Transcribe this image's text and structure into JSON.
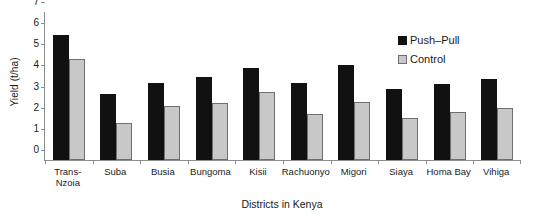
{
  "chart_data": {
    "type": "bar",
    "title": "",
    "xlabel": "Districts in Kenya",
    "ylabel": "Yield (t/ha)",
    "ylim": [
      0,
      7
    ],
    "yticks": [
      0,
      1,
      2,
      3,
      4,
      5,
      6,
      7
    ],
    "grid": false,
    "legend_position": "top-right",
    "categories": [
      "Trans-\nNzoia",
      "Suba",
      "Busia",
      "Bungoma",
      "Kisii",
      "Rachuonyo",
      "Migori",
      "Siaya",
      "Homa Bay",
      "Vihiga"
    ],
    "series": [
      {
        "name": "Push–Pull",
        "color": "#111111",
        "values": [
          5.9,
          3.1,
          3.65,
          3.95,
          4.35,
          3.65,
          4.5,
          3.35,
          3.6,
          3.85
        ]
      },
      {
        "name": "Control",
        "color": "#c8c8c8",
        "values": [
          4.8,
          1.75,
          2.55,
          2.7,
          3.2,
          2.2,
          2.75,
          2.0,
          2.25,
          2.45
        ]
      }
    ]
  }
}
